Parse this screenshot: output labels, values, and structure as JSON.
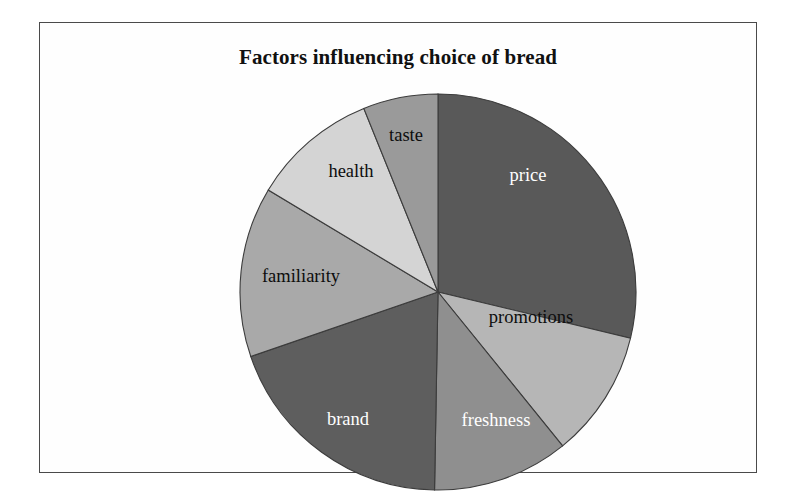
{
  "figure": {
    "title": "Factors influencing choice of bread",
    "background_color": "#ffffff",
    "frame_color": "#4a4a4a"
  },
  "chart_data": {
    "type": "pie",
    "title": "Factors influencing choice of bread",
    "subtitle": "",
    "xlabel": "",
    "ylabel": "",
    "grid": false,
    "legend": "none",
    "labels_inside_slices": true,
    "start_angle_deg": 0,
    "direction": "clockwise",
    "categories": [
      "price",
      "promotions",
      "freshness",
      "brand",
      "familiarity",
      "health",
      "taste"
    ],
    "values": [
      28.8,
      10.4,
      11.1,
      19.4,
      13.9,
      10.3,
      6.1
    ],
    "value_unit": "percent",
    "slices": [
      {
        "label": "price",
        "value": 28.8,
        "start_deg": 0.0,
        "end_deg": 103.5,
        "color": "#595959",
        "label_color": "#ffffff",
        "label_x": 290,
        "label_y": 85
      },
      {
        "label": "promotions",
        "value": 10.4,
        "start_deg": 103.5,
        "end_deg": 141.0,
        "color": "#b6b6b6",
        "label_color": "#0d0d0d",
        "label_x": 293,
        "label_y": 227
      },
      {
        "label": "freshness",
        "value": 11.1,
        "start_deg": 141.0,
        "end_deg": 181.0,
        "color": "#8f8f8f",
        "label_color": "#ffffff",
        "label_x": 258,
        "label_y": 330
      },
      {
        "label": "brand",
        "value": 19.4,
        "start_deg": 181.0,
        "end_deg": 251.0,
        "color": "#5e5e5e",
        "label_color": "#ffffff",
        "label_x": 110,
        "label_y": 329
      },
      {
        "label": "familiarity",
        "value": 13.9,
        "start_deg": 251.0,
        "end_deg": 301.0,
        "color": "#a9a9a9",
        "label_color": "#0d0d0d",
        "label_x": 63,
        "label_y": 186
      },
      {
        "label": "health",
        "value": 10.3,
        "start_deg": 301.0,
        "end_deg": 338.0,
        "color": "#d4d4d4",
        "label_color": "#0d0d0d",
        "label_x": 113,
        "label_y": 81
      },
      {
        "label": "taste",
        "value": 6.1,
        "start_deg": 338.0,
        "end_deg": 360.0,
        "color": "#9a9a9a",
        "label_color": "#0d0d0d",
        "label_x": 168,
        "label_y": 45
      }
    ],
    "geometry": {
      "center_x": 200,
      "center_y": 200,
      "radius": 198
    }
  }
}
